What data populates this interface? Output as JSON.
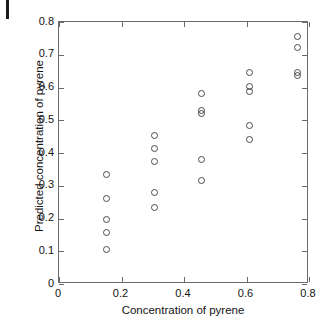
{
  "chart_data": {
    "type": "scatter",
    "title": "",
    "xlabel": "Concentration of pyrene",
    "ylabel": "Predicted concentration of pyrene",
    "xlim": [
      0,
      0.8
    ],
    "ylim": [
      0,
      0.8
    ],
    "xticks": [
      0,
      0.2,
      0.4,
      0.6,
      0.8
    ],
    "yticks": [
      0,
      0.1,
      0.2,
      0.3,
      0.4,
      0.5,
      0.6,
      0.7,
      0.8
    ],
    "xtick_labels": [
      "0",
      "0.2",
      "0.4",
      "0.6",
      "0.8"
    ],
    "ytick_labels": [
      "0",
      "0.1",
      "0.2",
      "0.3",
      "0.4",
      "0.5",
      "0.6",
      "0.7",
      "0.8"
    ],
    "grid": false,
    "legend": null,
    "marker": "open-circle",
    "marker_color": "#4a4a4a",
    "frame": "box",
    "tick_direction": "in",
    "points": [
      {
        "x": 0.152,
        "y": 0.333
      },
      {
        "x": 0.152,
        "y": 0.26
      },
      {
        "x": 0.152,
        "y": 0.196
      },
      {
        "x": 0.152,
        "y": 0.157
      },
      {
        "x": 0.152,
        "y": 0.105
      },
      {
        "x": 0.305,
        "y": 0.452
      },
      {
        "x": 0.305,
        "y": 0.414
      },
      {
        "x": 0.305,
        "y": 0.374
      },
      {
        "x": 0.305,
        "y": 0.278
      },
      {
        "x": 0.305,
        "y": 0.233
      },
      {
        "x": 0.455,
        "y": 0.582
      },
      {
        "x": 0.455,
        "y": 0.53
      },
      {
        "x": 0.455,
        "y": 0.521
      },
      {
        "x": 0.455,
        "y": 0.381
      },
      {
        "x": 0.455,
        "y": 0.315
      },
      {
        "x": 0.608,
        "y": 0.647
      },
      {
        "x": 0.608,
        "y": 0.602
      },
      {
        "x": 0.608,
        "y": 0.587
      },
      {
        "x": 0.608,
        "y": 0.483
      },
      {
        "x": 0.608,
        "y": 0.44
      },
      {
        "x": 0.763,
        "y": 0.756
      },
      {
        "x": 0.763,
        "y": 0.722
      },
      {
        "x": 0.763,
        "y": 0.646
      },
      {
        "x": 0.763,
        "y": 0.638
      }
    ]
  }
}
